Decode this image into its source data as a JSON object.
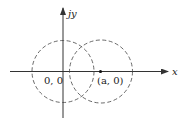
{
  "diagram": {
    "axes": {
      "x_label": "x",
      "y_label": "jy"
    },
    "circles": [
      {
        "name": "circle-origin",
        "center_label": "0, 0",
        "style": "dashed"
      },
      {
        "name": "circle-shifted",
        "center_label": "(a, 0)",
        "style": "dashed"
      }
    ],
    "points": [
      {
        "label": "(a, 0)",
        "marker": "dot"
      }
    ],
    "colors": {
      "stroke": "#333333",
      "background": "#ffffff"
    }
  }
}
